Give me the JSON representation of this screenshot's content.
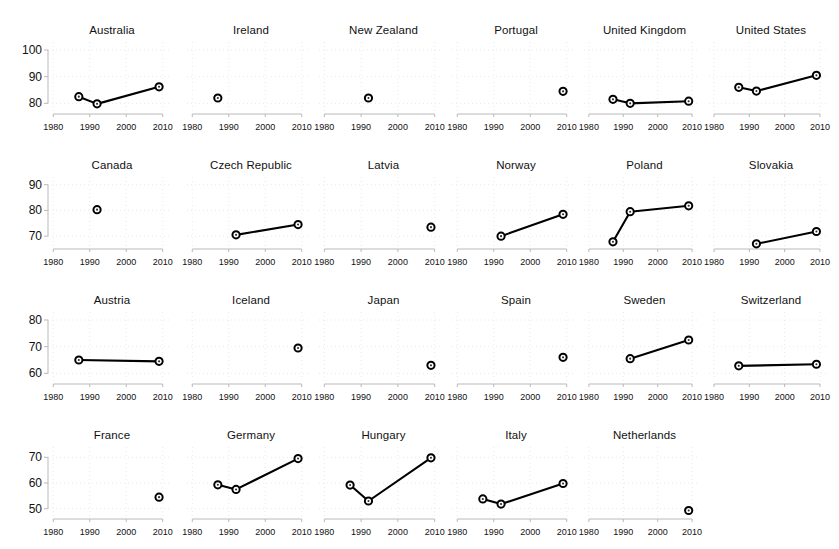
{
  "figure": {
    "type": "small-multiples-line-chart",
    "panel_columns": 6,
    "panel_rows": 4,
    "xlabel": "",
    "ylabel": "",
    "xticks": [
      1980,
      1990,
      2000,
      2010
    ],
    "xtick_labels": [
      "1980",
      "1990",
      "2000",
      "2010"
    ],
    "xlim": [
      1978,
      2012
    ],
    "grid": true,
    "legend": "none",
    "marker": "open-circle-with-dot",
    "line_color": "#000000",
    "grid_color": "#e9e9e9",
    "axis_color": "#b9b9b9"
  },
  "chart_data": {
    "type": "line",
    "title": "",
    "xlabel": "",
    "ylabel": "",
    "x": [
      1987,
      1992,
      2009
    ],
    "xlim": [
      1978,
      2012
    ],
    "xticks": [
      1980,
      1990,
      2000,
      2010
    ],
    "grid": true,
    "legend": "none",
    "rows": [
      {
        "row_index": 0,
        "ylim": [
          76,
          103
        ],
        "yticks": [
          80,
          90,
          100
        ],
        "ytick_labels": [
          "80",
          "90",
          "100"
        ],
        "panels": [
          {
            "name": "Australia",
            "points": [
              {
                "x": 1987,
                "y": 82.5
              },
              {
                "x": 1992,
                "y": 79.8
              },
              {
                "x": 2009,
                "y": 86.2
              }
            ]
          },
          {
            "name": "Ireland",
            "points": [
              {
                "x": 1987,
                "y": 82.0
              }
            ]
          },
          {
            "name": "New Zealand",
            "points": [
              {
                "x": 1992,
                "y": 82.0
              }
            ]
          },
          {
            "name": "Portugal",
            "points": [
              {
                "x": 2009,
                "y": 84.5
              }
            ]
          },
          {
            "name": "United Kingdom",
            "points": [
              {
                "x": 1987,
                "y": 81.5
              },
              {
                "x": 1992,
                "y": 80.0
              },
              {
                "x": 2009,
                "y": 80.8
              }
            ]
          },
          {
            "name": "United States",
            "points": [
              {
                "x": 1987,
                "y": 86.0
              },
              {
                "x": 1992,
                "y": 84.6
              },
              {
                "x": 2009,
                "y": 90.5
              }
            ]
          }
        ]
      },
      {
        "row_index": 1,
        "ylim": [
          65,
          93
        ],
        "yticks": [
          70,
          80,
          90
        ],
        "ytick_labels": [
          "70",
          "80",
          "90"
        ],
        "panels": [
          {
            "name": "Canada",
            "points": [
              {
                "x": 1992,
                "y": 80.3
              }
            ]
          },
          {
            "name": "Czech Republic",
            "points": [
              {
                "x": 1992,
                "y": 70.5
              },
              {
                "x": 2009,
                "y": 74.5
              }
            ]
          },
          {
            "name": "Latvia",
            "points": [
              {
                "x": 2009,
                "y": 73.5
              }
            ]
          },
          {
            "name": "Norway",
            "points": [
              {
                "x": 1992,
                "y": 70.0
              },
              {
                "x": 2009,
                "y": 78.5
              }
            ]
          },
          {
            "name": "Poland",
            "points": [
              {
                "x": 1987,
                "y": 67.8
              },
              {
                "x": 1992,
                "y": 79.5
              },
              {
                "x": 2009,
                "y": 81.8
              }
            ]
          },
          {
            "name": "Slovakia",
            "points": [
              {
                "x": 1992,
                "y": 67.0
              },
              {
                "x": 2009,
                "y": 71.8
              }
            ]
          }
        ]
      },
      {
        "row_index": 2,
        "ylim": [
          56,
          83
        ],
        "yticks": [
          60,
          70,
          80
        ],
        "ytick_labels": [
          "60",
          "70",
          "80"
        ],
        "panels": [
          {
            "name": "Austria",
            "points": [
              {
                "x": 1987,
                "y": 65.0
              },
              {
                "x": 2009,
                "y": 64.5
              }
            ]
          },
          {
            "name": "Iceland",
            "points": [
              {
                "x": 2009,
                "y": 69.5
              }
            ]
          },
          {
            "name": "Japan",
            "points": [
              {
                "x": 2009,
                "y": 63.0
              }
            ]
          },
          {
            "name": "Spain",
            "points": [
              {
                "x": 2009,
                "y": 66.0
              }
            ]
          },
          {
            "name": "Sweden",
            "points": [
              {
                "x": 1992,
                "y": 65.5
              },
              {
                "x": 2009,
                "y": 72.5
              }
            ]
          },
          {
            "name": "Switzerland",
            "points": [
              {
                "x": 1987,
                "y": 62.8
              },
              {
                "x": 2009,
                "y": 63.4
              }
            ]
          }
        ]
      },
      {
        "row_index": 3,
        "ylim": [
          46,
          74
        ],
        "yticks": [
          50,
          60,
          70
        ],
        "ytick_labels": [
          "50",
          "60",
          "70"
        ],
        "panels": [
          {
            "name": "France",
            "points": [
              {
                "x": 2009,
                "y": 54.5
              }
            ]
          },
          {
            "name": "Germany",
            "points": [
              {
                "x": 1987,
                "y": 59.3
              },
              {
                "x": 1992,
                "y": 57.5
              },
              {
                "x": 2009,
                "y": 69.5
              }
            ]
          },
          {
            "name": "Hungary",
            "points": [
              {
                "x": 1987,
                "y": 59.2
              },
              {
                "x": 1992,
                "y": 53.0
              },
              {
                "x": 2009,
                "y": 69.8
              }
            ]
          },
          {
            "name": "Italy",
            "points": [
              {
                "x": 1987,
                "y": 53.8
              },
              {
                "x": 1992,
                "y": 51.8
              },
              {
                "x": 2009,
                "y": 59.8
              }
            ]
          },
          {
            "name": "Netherlands",
            "points": [
              {
                "x": 2009,
                "y": 49.3
              }
            ]
          }
        ]
      }
    ]
  }
}
